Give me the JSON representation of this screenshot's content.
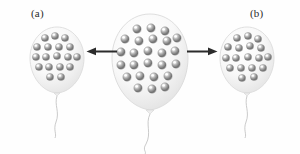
{
  "figure": {
    "background_color": "#fefefe",
    "width": 300,
    "height": 154
  },
  "labels": {
    "left_panel": "(a)",
    "right_panel": "(b)"
  },
  "palette": {
    "balloon_fill": "#f7f7f7",
    "balloon_outline": "#d8d8d8",
    "balloon_shadow": "#e9e9e9",
    "sphere_dark": "#6e6e6e",
    "sphere_mid": "#9a9a9a",
    "sphere_light": "#e8e8e8",
    "sphere_highlight": "#ffffff",
    "arrow_color": "#2b2b2b",
    "string_color": "#b5b5b5",
    "label_color": "#2b2b2b"
  },
  "balloons": [
    {
      "id": "left-balloon",
      "name": "balloon-a",
      "label": "(a)",
      "particle_count": 18,
      "cx": 57,
      "cy": 60,
      "rx": 27,
      "ry": 33,
      "particle_radius": 3.6,
      "particles": [
        [
          -12,
          -22
        ],
        [
          -2,
          -24
        ],
        [
          8,
          -22
        ],
        [
          -20,
          -13
        ],
        [
          -9,
          -13
        ],
        [
          2,
          -13
        ],
        [
          13,
          -13
        ],
        [
          -21,
          -3
        ],
        [
          -11,
          -3
        ],
        [
          0,
          -4
        ],
        [
          11,
          -3
        ],
        [
          20,
          -3
        ],
        [
          -18,
          7
        ],
        [
          -8,
          7
        ],
        [
          3,
          7
        ],
        [
          13,
          7
        ],
        [
          -7,
          17
        ],
        [
          4,
          17
        ]
      ]
    },
    {
      "id": "center-balloon",
      "name": "balloon-center",
      "label": "",
      "particle_count": 25,
      "cx": 150,
      "cy": 62,
      "rx": 38,
      "ry": 48,
      "particle_radius": 4.2,
      "particles": [
        [
          -13,
          -33
        ],
        [
          1,
          -34
        ],
        [
          15,
          -31
        ],
        [
          -25,
          -23
        ],
        [
          -11,
          -21
        ],
        [
          3,
          -23
        ],
        [
          17,
          -21
        ],
        [
          27,
          -24
        ],
        [
          -29,
          -10
        ],
        [
          -16,
          -9
        ],
        [
          -2,
          -11
        ],
        [
          12,
          -9
        ],
        [
          25,
          -11
        ],
        [
          -29,
          3
        ],
        [
          -16,
          3
        ],
        [
          -2,
          1
        ],
        [
          12,
          3
        ],
        [
          26,
          2
        ],
        [
          -23,
          15
        ],
        [
          -10,
          14
        ],
        [
          4,
          15
        ],
        [
          18,
          14
        ],
        [
          -12,
          26
        ],
        [
          2,
          27
        ],
        [
          15,
          25
        ]
      ]
    },
    {
      "id": "right-balloon",
      "name": "balloon-b",
      "label": "(b)",
      "particle_count": 18,
      "cx": 247,
      "cy": 60,
      "rx": 27,
      "ry": 33,
      "particle_radius": 3.6,
      "particles": [
        [
          -10,
          -22
        ],
        [
          1,
          -24
        ],
        [
          11,
          -21
        ],
        [
          -19,
          -13
        ],
        [
          -8,
          -12
        ],
        [
          3,
          -14
        ],
        [
          14,
          -12
        ],
        [
          -21,
          -2
        ],
        [
          -11,
          -2
        ],
        [
          1,
          -3
        ],
        [
          12,
          -2
        ],
        [
          21,
          -3
        ],
        [
          -17,
          8
        ],
        [
          -6,
          8
        ],
        [
          5,
          8
        ],
        [
          16,
          8
        ],
        [
          -5,
          18
        ],
        [
          7,
          17
        ]
      ]
    }
  ],
  "arrows": [
    {
      "id": "arrow-left",
      "name": "arrow-pointing-left",
      "direction": "left",
      "x": 88,
      "y": 51,
      "length": 28,
      "thickness": 3
    },
    {
      "id": "arrow-right",
      "name": "arrow-pointing-right",
      "direction": "right",
      "x": 188,
      "y": 51,
      "length": 28,
      "thickness": 3
    }
  ]
}
